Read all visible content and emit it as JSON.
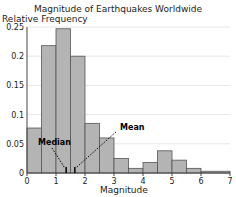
{
  "chart_data": {
    "type": "bar",
    "title": "Magnitude of Earthquakes Worldwide",
    "xlabel": "Magnitude",
    "ylabel": "Relative Frequency",
    "xlim": [
      0,
      7
    ],
    "ylim": [
      0,
      0.25
    ],
    "xticks": [
      "0",
      "1",
      "2",
      "3",
      "4",
      "5",
      "6",
      "7"
    ],
    "yticks": [
      "0",
      "0.05",
      "0.1",
      "0.15",
      "0.2",
      "0.25"
    ],
    "bins": [
      {
        "x0": 0,
        "x1": 0.5,
        "value": 0.077
      },
      {
        "x0": 0.5,
        "x1": 1,
        "value": 0.218
      },
      {
        "x0": 1,
        "x1": 1.5,
        "value": 0.247
      },
      {
        "x0": 1.5,
        "x1": 2,
        "value": 0.2
      },
      {
        "x0": 2,
        "x1": 2.5,
        "value": 0.085
      },
      {
        "x0": 2.5,
        "x1": 3,
        "value": 0.06
      },
      {
        "x0": 3,
        "x1": 3.5,
        "value": 0.025
      },
      {
        "x0": 3.5,
        "x1": 4,
        "value": 0.008
      },
      {
        "x0": 4,
        "x1": 4.5,
        "value": 0.018
      },
      {
        "x0": 4.5,
        "x1": 5,
        "value": 0.038
      },
      {
        "x0": 5,
        "x1": 5.5,
        "value": 0.022
      },
      {
        "x0": 5.5,
        "x1": 6,
        "value": 0.008
      },
      {
        "x0": 6,
        "x1": 7,
        "value": 0.003
      }
    ],
    "annotations": [
      {
        "label": "Median",
        "x": 1.35
      },
      {
        "label": "Mean",
        "x": 1.65
      }
    ],
    "grid": true
  }
}
